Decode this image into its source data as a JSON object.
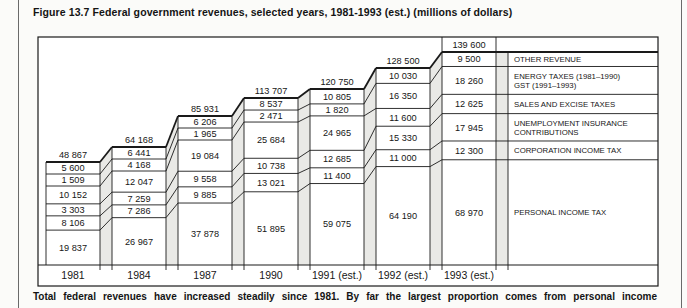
{
  "page": {
    "title": "Figure 13.7 Federal government revenues, selected years, 1981-1993 (est.) (millions of dollars)",
    "caption": "Total federal revenues have increased steadily since 1981. By far the largest proportion comes from personal income"
  },
  "chart_data": {
    "type": "bar",
    "variant": "stacked-step-3d",
    "title": "Federal government revenues, selected years, 1981-1993 (est.)",
    "unit": "millions of dollars",
    "xlabel": "",
    "ylabel": "",
    "grid": false,
    "legend_position": "right",
    "categories": [
      "1981",
      "1984",
      "1987",
      "1990",
      "1991 (est.)",
      "1992 (est.)",
      "1993 (est.)"
    ],
    "totals": [
      48867,
      64168,
      85931,
      113707,
      120750,
      128500,
      139600
    ],
    "series": [
      {
        "name": "OTHER REVENUE",
        "label_lines": [
          "OTHER REVENUE"
        ],
        "values": [
          5600,
          6441,
          6206,
          8537,
          10805,
          10030,
          9500
        ]
      },
      {
        "name": "ENERGY TAXES (1981–1990) / GST (1991–1993)",
        "label_lines": [
          "ENERGY TAXES (1981–1990)",
          "GST (1991–1993)"
        ],
        "values": [
          1509,
          4168,
          1965,
          2471,
          1820,
          16350,
          18260
        ]
      },
      {
        "name": "SALES AND EXCISE TAXES",
        "label_lines": [
          "SALES AND EXCISE TAXES"
        ],
        "values": [
          10152,
          12047,
          19084,
          25684,
          24965,
          11600,
          12625
        ]
      },
      {
        "name": "UNEMPLOYMENT INSURANCE CONTRIBUTIONS",
        "label_lines": [
          "UNEMPLOYMENT INSURANCE",
          "CONTRIBUTIONS"
        ],
        "values": [
          3303,
          7259,
          9558,
          10738,
          12685,
          15330,
          17945
        ]
      },
      {
        "name": "CORPORATION INCOME TAX",
        "label_lines": [
          "CORPORATION INCOME TAX"
        ],
        "values": [
          8106,
          7286,
          9885,
          13021,
          11400,
          11000,
          12300
        ]
      },
      {
        "name": "PERSONAL INCOME TAX",
        "label_lines": [
          "PERSONAL INCOME TAX"
        ],
        "values": [
          19837,
          26967,
          37878,
          51895,
          59075,
          64190,
          68970
        ]
      }
    ],
    "colors": {
      "line": "#1a1a1a",
      "strip": "#e9e9e6",
      "background": "#ffffff"
    }
  }
}
